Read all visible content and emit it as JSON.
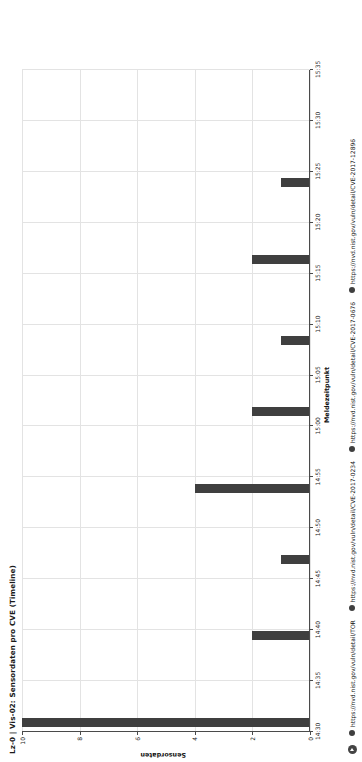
{
  "chart_data": {
    "type": "bar",
    "orientation": "horizontal-time",
    "title": "Lz-0 | Vis-02: Sensordaten pro CVE (Timeline)",
    "xlabel": "Meldezeitpunkt",
    "ylabel": "Sensordaten",
    "grid": true,
    "legend_position": "bottom",
    "ylim": [
      0,
      10
    ],
    "yticks": [
      "0",
      "2",
      "4",
      "6",
      "8",
      "10"
    ],
    "ytick_values": [
      0,
      2,
      4,
      6,
      8,
      10
    ],
    "xticks": [
      "14:30",
      "14:35",
      "14:40",
      "14:45",
      "14:50",
      "14:55",
      "15:00",
      "15:05",
      "15:10",
      "15:15",
      "15:20",
      "15:25",
      "15:30",
      "15:35"
    ],
    "series": [
      {
        "name": "https://nvd.nist.gov/vuln/detail/TOR",
        "color": "#3f3f3f",
        "points": [
          {
            "x": "14:30",
            "y": 10
          },
          {
            "x": "14:37",
            "y": 4
          },
          {
            "x": "15:11",
            "y": 3
          }
        ]
      },
      {
        "name": "https://nvd.nist.gov/vuln/detail/CVE-2017-0234",
        "color": "#3f3f3f",
        "points": [
          {
            "x": "14:34",
            "y": 2
          },
          {
            "x": "14:39",
            "y": 2
          },
          {
            "x": "15:15",
            "y": 2
          }
        ]
      },
      {
        "name": "https://nvd.nist.gov/vuln/detail/CVE-2017-0676",
        "color": "#3f3f3f",
        "points": [
          {
            "x": "14:36",
            "y": 1
          },
          {
            "x": "14:41",
            "y": 1
          },
          {
            "x": "15:12",
            "y": 1
          }
        ]
      },
      {
        "name": "https://nvd.nist.gov/vuln/detail/CVE-2017-12896",
        "color": "#3f3f3f",
        "points": [
          {
            "x": "14:43",
            "y": 2
          },
          {
            "x": "14:45",
            "y": 1
          },
          {
            "x": "15:13",
            "y": 1
          }
        ]
      }
    ],
    "bars": [
      {
        "cx": 0.5,
        "len": 10.0
      },
      {
        "cx": 9.0,
        "len": 2.0
      },
      {
        "cx": 16.5,
        "len": 1.0
      },
      {
        "cx": 23.5,
        "len": 4.0
      },
      {
        "cx": 31.0,
        "len": 2.0
      },
      {
        "cx": 38.0,
        "len": 1.0
      },
      {
        "cx": 46.0,
        "len": 2.0
      },
      {
        "cx": 53.5,
        "len": 1.0
      },
      {
        "cx": 191.0,
        "len": 3.0
      },
      {
        "cx": 198.5,
        "len": 1.0
      },
      {
        "cx": 206.0,
        "len": 1.0
      },
      {
        "cx": 219.0,
        "len": 2.0
      }
    ]
  },
  "legend": {
    "nav_icon": "play-circle-icon",
    "items": [
      {
        "label": "https://nvd.nist.gov/vuln/detail/TOR"
      },
      {
        "label": "https://nvd.nist.gov/vuln/detail/CVE-2017-0234"
      },
      {
        "label": "https://nvd.nist.gov/vuln/detail/CVE-2017-0676"
      },
      {
        "label": "https://nvd.nist.gov/vuln/detail/CVE-2017-12896"
      }
    ]
  },
  "colors": {
    "bar": "#3f3f3f",
    "grid": "#e3e3e3",
    "axis": "#4a4a4a",
    "text": "#111111"
  }
}
